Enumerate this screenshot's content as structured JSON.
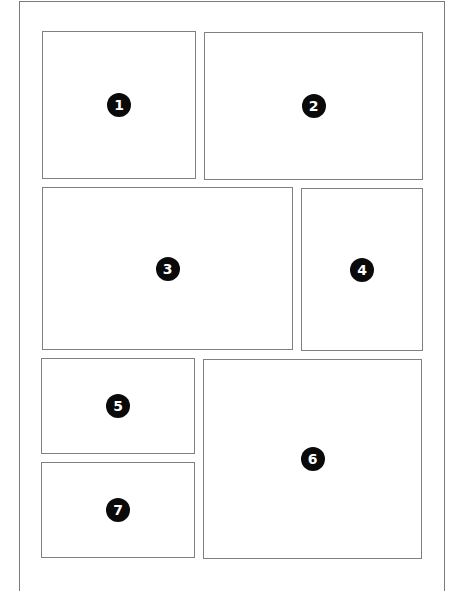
{
  "layout": {
    "description": "Comic page layout with seven numbered panels",
    "panels": [
      {
        "number": "1",
        "label": "1",
        "x": 42,
        "y": 31,
        "w": 154,
        "h": 148
      },
      {
        "number": "2",
        "label": "2",
        "x": 204,
        "y": 32,
        "w": 219,
        "h": 148
      },
      {
        "number": "3",
        "label": "3",
        "x": 42,
        "y": 187,
        "w": 251,
        "h": 163
      },
      {
        "number": "4",
        "label": "4",
        "x": 301,
        "y": 188,
        "w": 122,
        "h": 163
      },
      {
        "number": "5",
        "label": "5",
        "x": 41,
        "y": 358,
        "w": 154,
        "h": 96
      },
      {
        "number": "6",
        "label": "6",
        "x": 203,
        "y": 359,
        "w": 219,
        "h": 200
      },
      {
        "number": "7",
        "label": "7",
        "x": 41,
        "y": 462,
        "w": 154,
        "h": 96
      }
    ]
  },
  "colors": {
    "border": "#808080",
    "badge_fill": "#0a0a0a",
    "badge_text": "#ffffff",
    "background": "#ffffff"
  }
}
